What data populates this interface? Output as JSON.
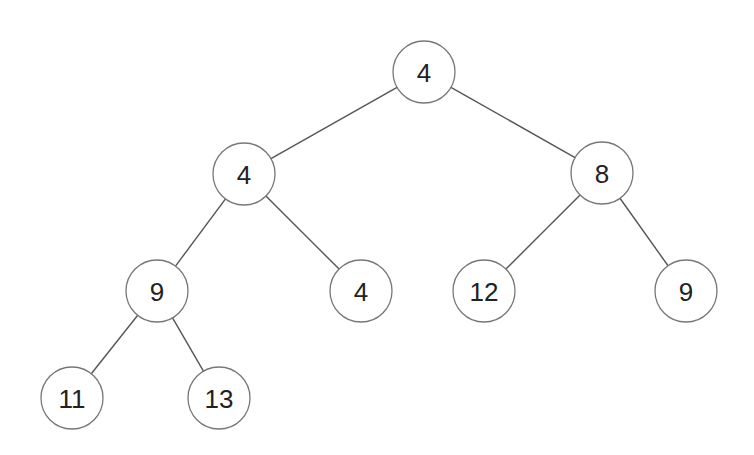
{
  "diagram": {
    "type": "binary-tree",
    "nodes": [
      {
        "id": "n0",
        "value": "4",
        "x": 424,
        "y": 72
      },
      {
        "id": "n1",
        "value": "4",
        "x": 244,
        "y": 174
      },
      {
        "id": "n2",
        "value": "8",
        "x": 602,
        "y": 173
      },
      {
        "id": "n3",
        "value": "9",
        "x": 157,
        "y": 291
      },
      {
        "id": "n4",
        "value": "4",
        "x": 361,
        "y": 291
      },
      {
        "id": "n5",
        "value": "12",
        "x": 484,
        "y": 291
      },
      {
        "id": "n6",
        "value": "9",
        "x": 686,
        "y": 291
      },
      {
        "id": "n7",
        "value": "11",
        "x": 72,
        "y": 398
      },
      {
        "id": "n8",
        "value": "13",
        "x": 219,
        "y": 398
      }
    ],
    "edges": [
      [
        "n0",
        "n1"
      ],
      [
        "n0",
        "n2"
      ],
      [
        "n1",
        "n3"
      ],
      [
        "n1",
        "n4"
      ],
      [
        "n2",
        "n5"
      ],
      [
        "n2",
        "n6"
      ],
      [
        "n3",
        "n7"
      ],
      [
        "n3",
        "n8"
      ]
    ],
    "radius": 31
  }
}
